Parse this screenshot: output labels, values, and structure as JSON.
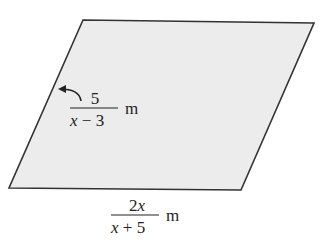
{
  "figure": {
    "shape": "parallelogram",
    "fill_color": "#ececec",
    "stroke_color": "#333333",
    "vertices": {
      "top_left": [
        83,
        20
      ],
      "top_right": [
        314,
        23
      ],
      "bottom_right": [
        241,
        190
      ],
      "bottom_left": [
        9,
        188
      ]
    }
  },
  "side_label": {
    "numerator": "5",
    "denominator_var": "x",
    "denominator_rest": " − 3",
    "unit": "m",
    "arrow": "curved-arrow-to-left-side"
  },
  "base_label": {
    "numerator_num": "2",
    "numerator_var": "x",
    "denominator_var": "x",
    "denominator_rest": " + 5",
    "unit": "m"
  }
}
